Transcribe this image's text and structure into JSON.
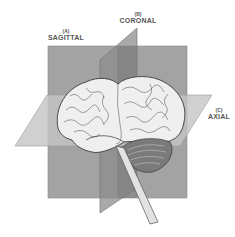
{
  "figure": {
    "labels": {
      "sagittal": {
        "letter": "(A)",
        "name": "SAGITTAL"
      },
      "coronal": {
        "letter": "(B)",
        "name": "CORONAL"
      },
      "axial": {
        "letter": "(C)",
        "name": "AXIAL"
      }
    },
    "colors": {
      "plane_fill": "#9c9c9c",
      "plane_dark": "#7a7a7a",
      "brain_fill": "#ececec",
      "brain_outline": "#444444",
      "cerebellum": "#6a6a6a",
      "label_text": "#555555"
    }
  }
}
